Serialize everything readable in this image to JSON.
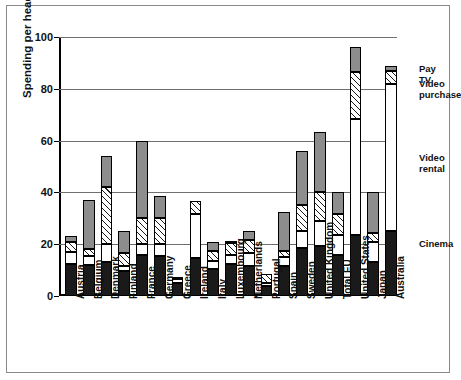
{
  "chart_data": {
    "type": "bar",
    "subtype": "stacked",
    "title": "",
    "xlabel": "",
    "ylabel": "Spending per head ($)",
    "ylim": [
      0,
      100
    ],
    "yticks": [
      0,
      20,
      40,
      60,
      80,
      100
    ],
    "grid": true,
    "legend_position": "right",
    "categories": [
      "Austria",
      "Belgium",
      "Denmark",
      "Finland",
      "France",
      "Germany",
      "Greece",
      "Ireland",
      "Italy",
      "Luxembourg",
      "Netherlands",
      "Portugal",
      "Spain",
      "Sweden",
      "United Kingdom",
      "Total EU",
      "United States",
      "Japan",
      "Australia"
    ],
    "series": [
      {
        "name": "Cinema",
        "color": "#1a1a1a",
        "values": [
          12.5,
          12.0,
          13.0,
          9.5,
          16.0,
          15.5,
          5.0,
          14.5,
          10.5,
          12.5,
          11.5,
          4.0,
          11.5,
          18.5,
          19.5,
          16.0,
          23.5,
          13.0,
          25.0
        ]
      },
      {
        "name": "Video rental",
        "color": "#ffffff",
        "values": [
          4.5,
          3.5,
          7.0,
          2.0,
          4.0,
          4.5,
          1.5,
          17.0,
          3.0,
          3.5,
          5.0,
          1.0,
          3.5,
          6.5,
          9.5,
          7.5,
          45.0,
          8.0,
          57.0
        ]
      },
      {
        "name": "Video purchase",
        "color": "#ffffff",
        "values": [
          4.0,
          2.5,
          22.0,
          5.0,
          10.0,
          10.0,
          1.0,
          5.0,
          4.0,
          4.5,
          5.0,
          3.5,
          2.5,
          10.0,
          11.0,
          8.0,
          18.0,
          3.5,
          5.0
        ]
      },
      {
        "name": "Pay TV",
        "color": "#8d8d8d",
        "values": [
          2.0,
          19.0,
          12.0,
          8.5,
          30.0,
          8.5,
          0.0,
          0.0,
          3.5,
          0.5,
          3.5,
          0.0,
          15.0,
          21.0,
          23.5,
          8.5,
          9.5,
          15.5,
          2.0
        ]
      }
    ],
    "totals": [
      23.0,
      37.0,
      54.0,
      25.0,
      60.0,
      38.5,
      7.5,
      36.5,
      21.0,
      21.0,
      25.0,
      8.5,
      32.5,
      56.0,
      63.5,
      40.0,
      96.0,
      40.0,
      89.0
    ]
  },
  "legend": {
    "items": [
      {
        "label": "Pay TV",
        "swatch": "paytv"
      },
      {
        "label": "Video\npurchase",
        "swatch": "video-purchase"
      },
      {
        "label": "Video\nrental",
        "swatch": "video-rental"
      },
      {
        "label": "Cinema",
        "swatch": "cinema"
      }
    ],
    "pay_tv": "Pay TV",
    "video_purchase_line1": "Video",
    "video_purchase_line2": "purchase",
    "video_rental_line1": "Video",
    "video_rental_line2": "rental",
    "cinema": "Cinema"
  }
}
